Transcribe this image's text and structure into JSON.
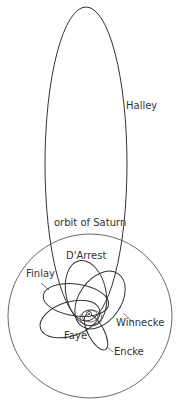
{
  "diagram": {
    "colors": {
      "line": "#333333",
      "background": "#ffffff"
    },
    "labels": {
      "halley": "Halley",
      "saturn": "orbit of Saturn",
      "darrest": "D'Arrest",
      "finlay": "Finlay",
      "winnecke": "Winnecke",
      "faye": "Faye",
      "encke": "Encke"
    },
    "center_icon": "sun-icon"
  }
}
